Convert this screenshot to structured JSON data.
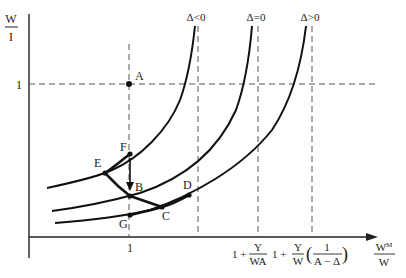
{
  "diagram": {
    "y_axis_label": {
      "numerator": "W",
      "denominator": "I"
    },
    "x_axis_label": {
      "numerator": "W",
      "superscript": "M",
      "denominator": "W"
    },
    "y_tick": "1",
    "x_tick": "1",
    "curve_labels": [
      "Δ<0",
      "Δ=0",
      "Δ>0"
    ],
    "x_asymptote_labels": {
      "first": {
        "prefix": "1 +",
        "numerator": "Y",
        "denominator": "WA"
      },
      "second": {
        "prefix": "1 +",
        "numerator": "Y",
        "denominator": "W",
        "paren_numerator": "1",
        "paren_denominator": "A − Δ"
      }
    },
    "points": {
      "A": "A",
      "B": "B",
      "C": "C",
      "D": "D",
      "E": "E",
      "F": "F",
      "G": "G"
    },
    "colors": {
      "ink": "#111111",
      "dashed": "#555555",
      "background": "#ffffff"
    }
  }
}
